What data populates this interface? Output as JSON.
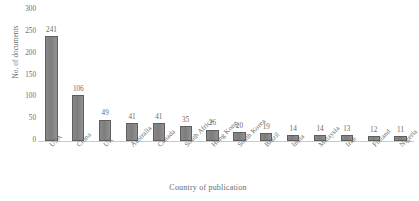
{
  "chart_data": {
    "type": "bar",
    "title": "",
    "xlabel": "Country of publication",
    "ylabel": "No. of documents",
    "categories": [
      "USA",
      "China",
      "UK",
      "Australia",
      "Canada",
      "South Africa",
      "Hong Kong",
      "South Korea",
      "Brazil",
      "India",
      "Malaysia",
      "Iran",
      "Finland",
      "Nigeria"
    ],
    "values": [
      241,
      106,
      49,
      41,
      41,
      35,
      26,
      20,
      19,
      14,
      14,
      13,
      12,
      11
    ],
    "ylim": [
      0,
      300
    ],
    "ytick_values": [
      0,
      50,
      100,
      150,
      200,
      250,
      300
    ],
    "ytick_labels": [
      "0",
      "50",
      "100",
      "150",
      "200",
      "250",
      "300"
    ],
    "grid": false,
    "legend": false,
    "bar_color": "#808080",
    "bar_border_color": "#5e5e5e",
    "text_color": "#6a6a6a",
    "background": "#ffffff",
    "xtick_rotation": -45,
    "data_labels": [
      "241",
      "106",
      "49",
      "41",
      "41",
      "35",
      "26",
      "20",
      "19",
      "14",
      "14",
      "13",
      "12",
      "11"
    ]
  }
}
